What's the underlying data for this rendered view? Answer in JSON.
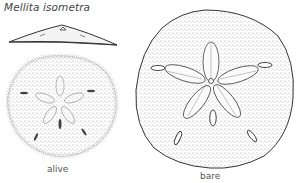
{
  "figure": {
    "title": "Mellita isometra",
    "labels": {
      "alive": "alive",
      "bare": "bare"
    },
    "illustrations": [
      {
        "name": "side-profile",
        "description": "side view of sand dollar"
      },
      {
        "name": "alive-specimen",
        "description": "living sand dollar, stippled"
      },
      {
        "name": "bare-specimen",
        "description": "bare test with petaloid star and lunules"
      }
    ],
    "colors": {
      "ink": "#333333",
      "background": "#ffffff"
    }
  }
}
